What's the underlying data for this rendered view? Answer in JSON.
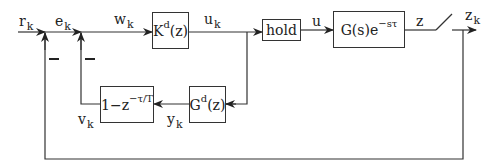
{
  "diagram": {
    "type": "block-diagram",
    "signals": {
      "r": {
        "base": "r",
        "sub": "k"
      },
      "e": {
        "base": "e",
        "sub": "k"
      },
      "w": {
        "base": "w",
        "sub": "k"
      },
      "u_k": {
        "base": "u",
        "sub": "k"
      },
      "u": {
        "base": "u"
      },
      "z": {
        "base": "z"
      },
      "z_k": {
        "base": "z",
        "sub": "k"
      },
      "v": {
        "base": "v",
        "sub": "k"
      },
      "y": {
        "base": "y",
        "sub": "k"
      }
    },
    "blocks": {
      "controller": {
        "base": "K",
        "sup": "d",
        "arg": "(z)"
      },
      "hold": {
        "label": "hold"
      },
      "plant": {
        "base": "G(s)e",
        "sup": "−sτ"
      },
      "predictor": {
        "base": "G",
        "sup": "d",
        "arg": "(z)"
      },
      "delay_comp": {
        "base": "1−z",
        "sup": "−τ/T"
      }
    },
    "summing_junctions": [
      {
        "id": "sum1",
        "inputs": [
          "r_k",
          "−z_k"
        ],
        "output": "e_k",
        "feedback_sign": "−"
      },
      {
        "id": "sum2",
        "inputs": [
          "e_k",
          "−v_k"
        ],
        "output": "w_k",
        "feedback_sign": "−"
      }
    ],
    "sampler": {
      "type": "switch",
      "input": "z",
      "output": "z_k"
    }
  }
}
